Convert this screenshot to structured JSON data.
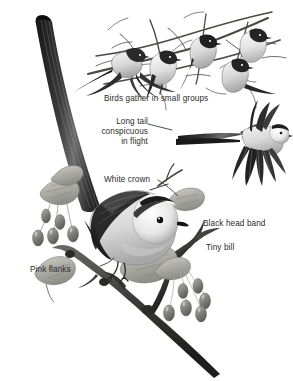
{
  "plate": {
    "subject": "Long-tailed Tit",
    "background_color": "#ffffff",
    "ink_color": "#2b2b2b",
    "style": "grayscale field-guide illustration"
  },
  "labels": {
    "flock": "Birds gather in small groups",
    "long_tail_line1": "Long tail",
    "long_tail_line2": "conspicuous",
    "long_tail_line3": "in flight",
    "white_crown": "White crown",
    "black_head_band": "Black head band",
    "tiny_bill": "Tiny bill",
    "pink_flanks": "Pink flanks"
  },
  "figures": {
    "flock_scene": "five-birds-on-bare-branches",
    "flight_bird": "bird-in-flight-with-long-tail",
    "main_bird": "perched-bird-on-berry-branch",
    "foliage": "maple-like-leaves-and-hanging-oval-berries"
  }
}
